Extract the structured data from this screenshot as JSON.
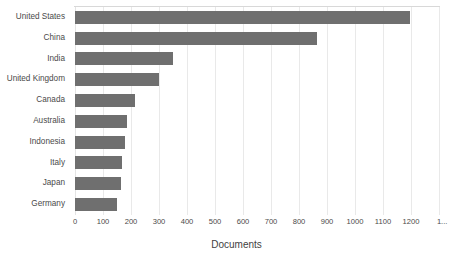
{
  "chart_data": {
    "type": "bar",
    "orientation": "horizontal",
    "title": "",
    "xlabel": "Documents",
    "ylabel": "",
    "categories": [
      "United States",
      "China",
      "India",
      "United Kingdom",
      "Canada",
      "Australia",
      "Indonesia",
      "Italy",
      "Japan",
      "Germany"
    ],
    "values": [
      1195,
      865,
      350,
      300,
      215,
      185,
      180,
      168,
      163,
      150
    ],
    "xlim": [
      0,
      1300
    ],
    "xticks": [
      0,
      100,
      200,
      300,
      400,
      500,
      600,
      700,
      800,
      900,
      1000,
      1100,
      1200,
      1300
    ],
    "xtick_labels": [
      "0",
      "100",
      "200",
      "300",
      "400",
      "500",
      "600",
      "700",
      "800",
      "900",
      "1000",
      "1100",
      "1200",
      "1..."
    ],
    "grid": true,
    "grid_axis": "x",
    "legend": null,
    "bar_color": "#6f6f6f",
    "grid_color": "#e9e9e9",
    "background": "#ffffff"
  }
}
